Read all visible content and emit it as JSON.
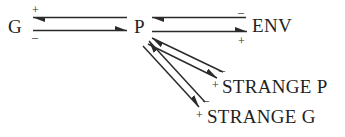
{
  "diagram": {
    "type": "signed-interaction-diagram",
    "stroke_color": "#2b2b2b",
    "background_color": "#ffffff",
    "nodes": [
      {
        "id": "g",
        "label": "G"
      },
      {
        "id": "p",
        "label": "P"
      },
      {
        "id": "env",
        "label": "ENV"
      },
      {
        "id": "strange_p",
        "label": "STRANGE P"
      },
      {
        "id": "strange_g",
        "label": "STRANGE G"
      }
    ],
    "edges": [
      {
        "id": "p-to-g",
        "from": "P",
        "to": "G",
        "sign": "+",
        "sign_position": "above-left"
      },
      {
        "id": "g-to-p",
        "from": "G",
        "to": "P",
        "sign": "-",
        "sign_position": "below-left"
      },
      {
        "id": "env-to-p",
        "from": "ENV",
        "to": "P",
        "sign": "-",
        "sign_position": "above-right"
      },
      {
        "id": "p-to-env",
        "from": "P",
        "to": "ENV",
        "sign": "+",
        "sign_position": "below-right"
      },
      {
        "id": "strangep-to-p",
        "from": "STRANGE P",
        "to": "P",
        "sign": "-",
        "sign_position": "above-right"
      },
      {
        "id": "p-to-strangep",
        "from": "P",
        "to": "STRANGE P",
        "sign": "+",
        "sign_position": "below-right"
      },
      {
        "id": "strangeg-to-p",
        "from": "STRANGE G",
        "to": "P",
        "sign": "-",
        "sign_position": "above-right"
      },
      {
        "id": "p-to-strangeg",
        "from": "P",
        "to": "STRANGE G",
        "sign": "+",
        "sign_position": "below-right"
      }
    ],
    "signs": {
      "g_plus": "+",
      "g_minus": "–",
      "env_minus": "–",
      "env_plus": "+",
      "strangep_minus": "–",
      "strangep_plus": "+",
      "strangeg_minus": "–",
      "strangeg_plus": "+"
    }
  }
}
